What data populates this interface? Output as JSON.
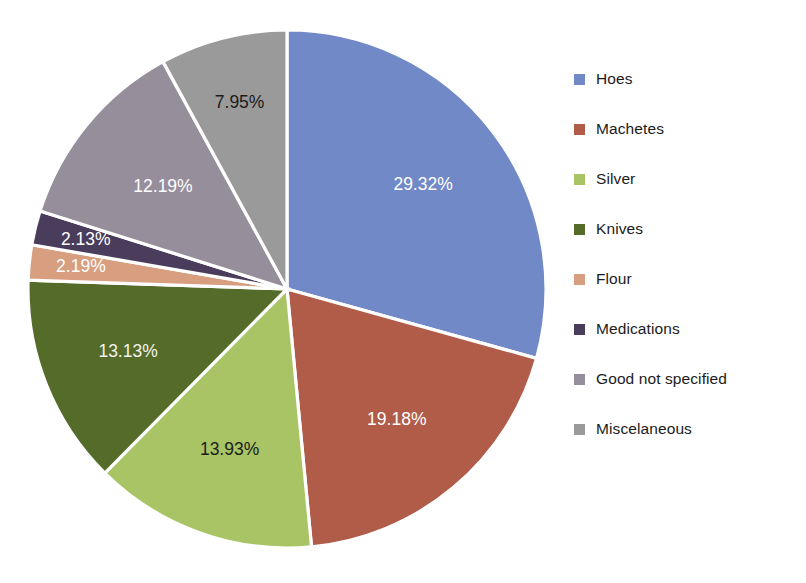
{
  "chart_data": {
    "type": "pie",
    "title": "",
    "xlabel": "",
    "ylabel": "",
    "grid": false,
    "legend_position": "right",
    "start_angle_deg": 0,
    "direction": "clockwise",
    "value_unit": "percent",
    "categories": [
      "Hoes",
      "Machetes",
      "Silver",
      "Knives",
      "Flour",
      "Medications",
      "Good not specified",
      "Miscelaneous"
    ],
    "values": [
      29.32,
      19.18,
      13.93,
      13.13,
      2.19,
      2.13,
      12.19,
      7.95
    ],
    "data_labels": [
      "29.32%",
      "19.18%",
      "13.93%",
      "13.13%",
      "2.19%",
      "2.13%",
      "12.19%",
      "7.95%"
    ],
    "colors": [
      "#7189c7",
      "#b05c48",
      "#a8c465",
      "#556b2a",
      "#d79e80",
      "#4a3d5c",
      "#978e9c",
      "#9a9a9a"
    ],
    "label_text_colors": [
      "#ffffff",
      "#ffffff",
      "#1b1b1b",
      "#f2f2ee",
      "#ffffff",
      "#ffffff",
      "#ffffff",
      "#1b1b1b"
    ],
    "slices": [
      {
        "label": "Hoes",
        "value": 29.32,
        "data_label": "29.32%",
        "color": "#7189c7"
      },
      {
        "label": "Machetes",
        "value": 19.18,
        "data_label": "19.18%",
        "color": "#b05c48"
      },
      {
        "label": "Silver",
        "value": 13.93,
        "data_label": "13.93%",
        "color": "#a8c465"
      },
      {
        "label": "Knives",
        "value": 13.13,
        "data_label": "13.13%",
        "color": "#556b2a"
      },
      {
        "label": "Flour",
        "value": 2.19,
        "data_label": "2.19%",
        "color": "#d79e80"
      },
      {
        "label": "Medications",
        "value": 2.13,
        "data_label": "2.13%",
        "color": "#4a3d5c"
      },
      {
        "label": "Good not specified",
        "value": 12.19,
        "data_label": "12.19%",
        "color": "#978e9c"
      },
      {
        "label": "Miscelaneous",
        "value": 7.95,
        "data_label": "7.95%",
        "color": "#9a9a9a"
      }
    ]
  },
  "legend": {
    "items": [
      {
        "label": "Hoes",
        "color": "#7189c7"
      },
      {
        "label": "Machetes",
        "color": "#b05c48"
      },
      {
        "label": "Silver",
        "color": "#a8c465"
      },
      {
        "label": "Knives",
        "color": "#556b2a"
      },
      {
        "label": "Flour",
        "color": "#d79e80"
      },
      {
        "label": "Medications",
        "color": "#4a3d5c"
      },
      {
        "label": "Good not specified",
        "color": "#978e9c"
      },
      {
        "label": "Miscelaneous",
        "color": "#9a9a9a"
      }
    ]
  },
  "geometry": {
    "center_x": 287,
    "center_y": 289,
    "radius": 259,
    "label_radius_factor": 0.66
  },
  "title_remnant": ""
}
